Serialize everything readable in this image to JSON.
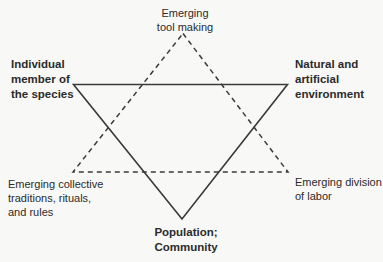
{
  "diagram": {
    "labels": {
      "top": {
        "text": "Emerging\ntool making",
        "bold": false
      },
      "left": {
        "text": "Individual\nmember of\nthe species",
        "bold": true
      },
      "right": {
        "text": "Natural and\nartificial\nenvironment",
        "bold": true
      },
      "bottom_left": {
        "text": "Emerging collective\ntraditions, rituals,\nand rules",
        "bold": false
      },
      "bottom_right": {
        "text": "Emerging division\nof labor",
        "bold": false
      },
      "bottom": {
        "text": "Population;\nCommunity",
        "bold": true
      }
    },
    "colors": {
      "background": "#f8f8f6",
      "line": "#3a3a3a",
      "text": "#2b2b2b"
    },
    "line_styles": {
      "solid_triangle": "solid, points down",
      "dashed_triangle": "dashed, points up"
    }
  }
}
